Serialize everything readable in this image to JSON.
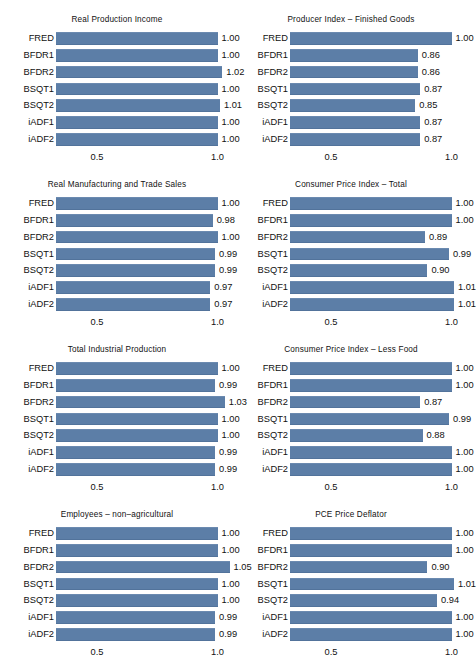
{
  "figure": {
    "background": "#ffffff",
    "bar_color": "#5c7ea7",
    "text_color": "#111111",
    "categories": [
      "FRED",
      "BFDR1",
      "BFDR2",
      "BSQT1",
      "BSQT2",
      "iADF1",
      "iADF2"
    ],
    "axis": {
      "ticks": [
        0.5,
        1.0
      ],
      "tick_labels": [
        "0.5",
        "1.0"
      ],
      "xmin": 0.33,
      "xmax": 1.06
    }
  },
  "chart_data": [
    {
      "type": "bar",
      "title": "Real Production Income",
      "xlabel": "",
      "ylabel": "",
      "orientation": "horizontal",
      "categories": [
        "FRED",
        "BFDR1",
        "BFDR2",
        "BSQT1",
        "BSQT2",
        "iADF1",
        "iADF2"
      ],
      "values": [
        1.0,
        1.0,
        1.02,
        1.0,
        1.01,
        1.0,
        1.0
      ],
      "labels": [
        "1.00",
        "1.00",
        "1.02",
        "1.00",
        "1.01",
        "1.00",
        "1.00"
      ],
      "xticks": [
        0.5,
        1.0
      ],
      "xtick_labels": [
        "0.5",
        "1.0"
      ],
      "xlim": [
        0.33,
        1.06
      ],
      "grid": false,
      "legend": null
    },
    {
      "type": "bar",
      "title": "Producer Index – Finished Goods",
      "xlabel": "",
      "ylabel": "",
      "orientation": "horizontal",
      "categories": [
        "FRED",
        "BFDR1",
        "BFDR2",
        "BSQT1",
        "BSQT2",
        "iADF1",
        "iADF2"
      ],
      "values": [
        1.0,
        0.86,
        0.86,
        0.87,
        0.85,
        0.87,
        0.87
      ],
      "labels": [
        "1.00",
        "0.86",
        "0.86",
        "0.87",
        "0.85",
        "0.87",
        "0.87"
      ],
      "xticks": [
        0.5,
        1.0
      ],
      "xtick_labels": [
        "0.5",
        "1.0"
      ],
      "xlim": [
        0.33,
        1.06
      ],
      "grid": false,
      "legend": null
    },
    {
      "type": "bar",
      "title": "Real Manufacturing and Trade Sales",
      "xlabel": "",
      "ylabel": "",
      "orientation": "horizontal",
      "categories": [
        "FRED",
        "BFDR1",
        "BFDR2",
        "BSQT1",
        "BSQT2",
        "iADF1",
        "iADF2"
      ],
      "values": [
        1.0,
        0.98,
        1.0,
        0.99,
        0.99,
        0.97,
        0.97
      ],
      "labels": [
        "1.00",
        "0.98",
        "1.00",
        "0.99",
        "0.99",
        "0.97",
        "0.97"
      ],
      "xticks": [
        0.5,
        1.0
      ],
      "xtick_labels": [
        "0.5",
        "1.0"
      ],
      "xlim": [
        0.33,
        1.06
      ],
      "grid": false,
      "legend": null
    },
    {
      "type": "bar",
      "title": "Consumer Price Index – Total",
      "xlabel": "",
      "ylabel": "",
      "orientation": "horizontal",
      "categories": [
        "FRED",
        "BFDR1",
        "BFDR2",
        "BSQT1",
        "BSQT2",
        "iADF1",
        "iADF2"
      ],
      "values": [
        1.0,
        1.0,
        0.89,
        0.99,
        0.9,
        1.01,
        1.01
      ],
      "labels": [
        "1.00",
        "1.00",
        "0.89",
        "0.99",
        "0.90",
        "1.01",
        "1.01"
      ],
      "xticks": [
        0.5,
        1.0
      ],
      "xtick_labels": [
        "0.5",
        "1.0"
      ],
      "xlim": [
        0.33,
        1.06
      ],
      "grid": false,
      "legend": null
    },
    {
      "type": "bar",
      "title": "Total Industrial Production",
      "xlabel": "",
      "ylabel": "",
      "orientation": "horizontal",
      "categories": [
        "FRED",
        "BFDR1",
        "BFDR2",
        "BSQT1",
        "BSQT2",
        "iADF1",
        "iADF2"
      ],
      "values": [
        1.0,
        0.99,
        1.03,
        1.0,
        1.0,
        0.99,
        0.99
      ],
      "labels": [
        "1.00",
        "0.99",
        "1.03",
        "1.00",
        "1.00",
        "0.99",
        "0.99"
      ],
      "xticks": [
        0.5,
        1.0
      ],
      "xtick_labels": [
        "0.5",
        "1.0"
      ],
      "xlim": [
        0.33,
        1.06
      ],
      "grid": false,
      "legend": null
    },
    {
      "type": "bar",
      "title": "Consumer Price Index – Less Food",
      "xlabel": "",
      "ylabel": "",
      "orientation": "horizontal",
      "categories": [
        "FRED",
        "BFDR1",
        "BFDR2",
        "BSQT1",
        "BSQT2",
        "iADF1",
        "iADF2"
      ],
      "values": [
        1.0,
        1.0,
        0.87,
        0.99,
        0.88,
        1.0,
        1.0
      ],
      "labels": [
        "1.00",
        "1.00",
        "0.87",
        "0.99",
        "0.88",
        "1.00",
        "1.00"
      ],
      "xticks": [
        0.5,
        1.0
      ],
      "xtick_labels": [
        "0.5",
        "1.0"
      ],
      "xlim": [
        0.33,
        1.06
      ],
      "grid": false,
      "legend": null
    },
    {
      "type": "bar",
      "title": "Employees – non–agricultural",
      "xlabel": "",
      "ylabel": "",
      "orientation": "horizontal",
      "categories": [
        "FRED",
        "BFDR1",
        "BFDR2",
        "BSQT1",
        "BSQT2",
        "iADF1",
        "iADF2"
      ],
      "values": [
        1.0,
        1.0,
        1.05,
        1.0,
        1.0,
        0.99,
        0.99
      ],
      "labels": [
        "1.00",
        "1.00",
        "1.05",
        "1.00",
        "1.00",
        "0.99",
        "0.99"
      ],
      "xticks": [
        0.5,
        1.0
      ],
      "xtick_labels": [
        "0.5",
        "1.0"
      ],
      "xlim": [
        0.33,
        1.06
      ],
      "grid": false,
      "legend": null
    },
    {
      "type": "bar",
      "title": "PCE Price Deflator",
      "xlabel": "",
      "ylabel": "",
      "orientation": "horizontal",
      "categories": [
        "FRED",
        "BFDR1",
        "BFDR2",
        "BSQT1",
        "BSQT2",
        "iADF1",
        "iADF2"
      ],
      "values": [
        1.0,
        1.0,
        0.9,
        1.01,
        0.94,
        1.0,
        1.0
      ],
      "labels": [
        "1.00",
        "1.00",
        "0.90",
        "1.01",
        "0.94",
        "1.00",
        "1.00"
      ],
      "xticks": [
        0.5,
        1.0
      ],
      "xtick_labels": [
        "0.5",
        "1.0"
      ],
      "xlim": [
        0.33,
        1.06
      ],
      "grid": false,
      "legend": null
    }
  ]
}
